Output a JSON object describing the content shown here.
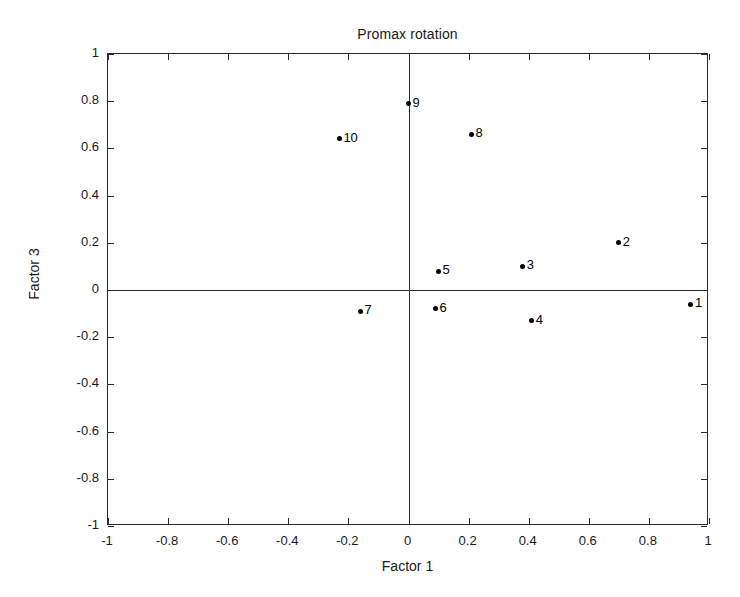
{
  "chart_data": {
    "type": "scatter",
    "title": "Promax rotation",
    "xlabel": "Factor 1",
    "ylabel": "Factor 3",
    "xlim": [
      -1,
      1
    ],
    "ylim": [
      -1,
      1
    ],
    "grid": false,
    "legend": "none",
    "xticks": [
      "-1",
      "-0.8",
      "-0.6",
      "-0.4",
      "-0.2",
      "0",
      "0.2",
      "0.4",
      "0.6",
      "0.8",
      "1"
    ],
    "xtickvalues": [
      -1,
      -0.8,
      -0.6,
      -0.4,
      -0.2,
      0,
      0.2,
      0.4,
      0.6,
      0.8,
      1
    ],
    "yticks": [
      "1",
      "0.8",
      "0.6",
      "0.4",
      "0.2",
      "0",
      "-0.2",
      "-0.4",
      "-0.6",
      "-0.8",
      "-1"
    ],
    "ytickvalues": [
      1,
      0.8,
      0.6,
      0.4,
      0.2,
      0,
      -0.2,
      -0.4,
      -0.6,
      -0.8,
      -1
    ],
    "reference_lines": {
      "vertical_x": 0,
      "horizontal_y": 0
    },
    "marker": {
      "shape": "circle",
      "color": "#000000",
      "size_px": 5
    },
    "points": [
      {
        "label": "1",
        "x": 0.94,
        "y": -0.06,
        "label_side": "right"
      },
      {
        "label": "2",
        "x": 0.7,
        "y": 0.2,
        "label_side": "right"
      },
      {
        "label": "3",
        "x": 0.38,
        "y": 0.1,
        "label_side": "right"
      },
      {
        "label": "4",
        "x": 0.41,
        "y": -0.13,
        "label_side": "right"
      },
      {
        "label": "5",
        "x": 0.1,
        "y": 0.08,
        "label_side": "right"
      },
      {
        "label": "6",
        "x": 0.09,
        "y": -0.08,
        "label_side": "right"
      },
      {
        "label": "7",
        "x": -0.16,
        "y": -0.09,
        "label_side": "right"
      },
      {
        "label": "8",
        "x": 0.21,
        "y": 0.66,
        "label_side": "right"
      },
      {
        "label": "9",
        "x": 0.0,
        "y": 0.79,
        "label_side": "right"
      },
      {
        "label": "10",
        "x": -0.23,
        "y": 0.64,
        "label_side": "right"
      }
    ]
  }
}
